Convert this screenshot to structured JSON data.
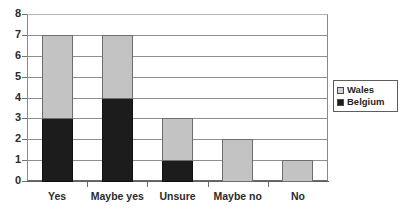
{
  "chart_data": {
    "type": "bar",
    "subtype": "stacked-column",
    "title": "",
    "xlabel": "",
    "ylabel": "",
    "categories": [
      "Yes",
      "Maybe yes",
      "Unsure",
      "Maybe no",
      "No"
    ],
    "series": [
      {
        "name": "Belgium",
        "color": "#1c1c1c",
        "values": [
          3,
          4,
          1,
          0,
          0
        ]
      },
      {
        "name": "Wales",
        "color": "#c3c3c3",
        "values": [
          4,
          3,
          2,
          2,
          1
        ]
      }
    ],
    "stack_totals": [
      7,
      7,
      3,
      2,
      1
    ],
    "ylim": [
      0,
      8
    ],
    "ytick_labels": [
      "0",
      "1",
      "2",
      "3",
      "4",
      "5",
      "6",
      "7",
      "8"
    ],
    "ytick_values": [
      0,
      1,
      2,
      3,
      4,
      5,
      6,
      7,
      8
    ],
    "grid": "horizontal",
    "legend_position": "right",
    "legend_entries": [
      {
        "label": "Wales",
        "swatch": "light-gray"
      },
      {
        "label": "Belgium",
        "swatch": "black"
      }
    ]
  }
}
